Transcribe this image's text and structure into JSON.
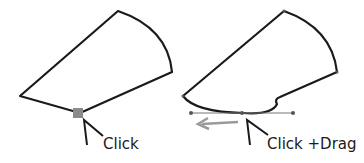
{
  "left_panel": {
    "caption": "Click"
  },
  "right_panel": {
    "caption": "Click +Drag"
  },
  "colors": {
    "stroke": "#1a1a1a",
    "marker": "#8a8a8a",
    "arrow": "#9a9a9a",
    "handle": "#777777"
  }
}
